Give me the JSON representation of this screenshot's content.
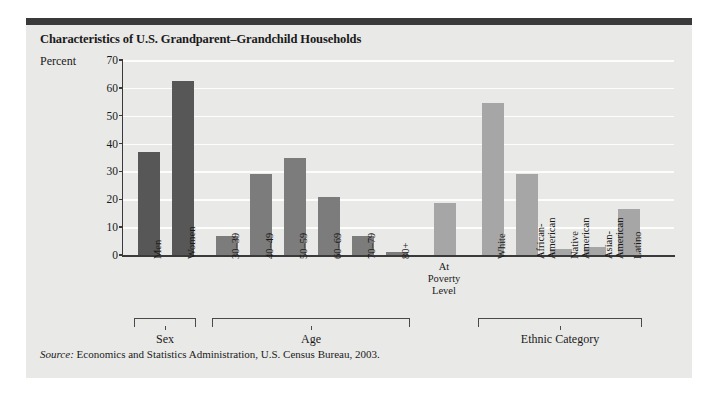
{
  "figure": {
    "title": "Characteristics of U.S. Grandparent–Grandchild Households",
    "axis_label": "Percent",
    "source_prefix": "Source:",
    "source_text": " Economics and Statistics Administration, U.S. Census Bureau, 2003."
  },
  "colors": {
    "panel_background": "#e9e9e7",
    "top_rule": "#3a3a3a",
    "gridline": "#fdfdfc",
    "axis": "#3a3a3a",
    "bar_sex": "#575757",
    "bar_age": "#7c7c7c",
    "bar_ethnic": "#a6a6a6",
    "text": "#1a1a1a"
  },
  "chart_data": {
    "type": "bar",
    "title": "Characteristics of U.S. Grandparent–Grandchild Households",
    "xlabel": "",
    "ylabel": "Percent",
    "ylim": [
      0,
      70
    ],
    "yticks": [
      0,
      10,
      20,
      30,
      40,
      50,
      60,
      70
    ],
    "ytick_labels": [
      "0",
      "10",
      "20",
      "30",
      "40",
      "50",
      "60",
      "70"
    ],
    "grid": true,
    "legend": "none",
    "categories": [
      "Men",
      "Women",
      "30–39",
      "40–49",
      "50–59",
      "60–69",
      "70–79",
      "80+",
      "At Poverty Level",
      "White",
      "African-American",
      "Native American",
      "Asian-American",
      "Latino"
    ],
    "values": [
      37,
      62.5,
      7,
      29,
      35,
      21,
      7,
      1,
      18.5,
      54.5,
      29,
      2,
      3,
      16.5
    ],
    "groups": [
      {
        "label": "Sex",
        "categories": [
          "Men",
          "Women"
        ]
      },
      {
        "label": "Age",
        "categories": [
          "30–39",
          "40–49",
          "50–59",
          "60–69",
          "70–79",
          "80+"
        ]
      },
      {
        "label": "Ethnic Category",
        "categories": [
          "White",
          "African-American",
          "Native American",
          "Asian-American",
          "Latino"
        ]
      }
    ],
    "ungrouped": [
      "At Poverty Level"
    ],
    "source": "Source: Economics and Statistics Administration, U.S. Census Bureau, 2003."
  },
  "bars": [
    {
      "label": "Men",
      "label_lines": [
        "Men"
      ],
      "value": 37,
      "group": "sex",
      "rotated": true
    },
    {
      "label": "Women",
      "label_lines": [
        "Women"
      ],
      "value": 62.5,
      "group": "sex",
      "rotated": true
    },
    {
      "label": "30–39",
      "label_lines": [
        "30–39"
      ],
      "value": 7,
      "group": "age",
      "rotated": true
    },
    {
      "label": "40–49",
      "label_lines": [
        "40–49"
      ],
      "value": 29,
      "group": "age",
      "rotated": true
    },
    {
      "label": "50–59",
      "label_lines": [
        "50–59"
      ],
      "value": 35,
      "group": "age",
      "rotated": true
    },
    {
      "label": "60–69",
      "label_lines": [
        "60–69"
      ],
      "value": 21,
      "group": "age",
      "rotated": true
    },
    {
      "label": "70–79",
      "label_lines": [
        "70–79"
      ],
      "value": 7,
      "group": "age",
      "rotated": true
    },
    {
      "label": "80+",
      "label_lines": [
        "80+"
      ],
      "value": 1,
      "group": "age",
      "rotated": true
    },
    {
      "label": "At Poverty Level",
      "label_lines": [
        "At",
        "Poverty",
        "Level"
      ],
      "value": 18.5,
      "group": "poverty",
      "rotated": false
    },
    {
      "label": "White",
      "label_lines": [
        "White"
      ],
      "value": 54.5,
      "group": "ethnic",
      "rotated": true
    },
    {
      "label": "African-American",
      "label_lines": [
        "African-",
        "American"
      ],
      "value": 29,
      "group": "ethnic",
      "rotated": true
    },
    {
      "label": "Native American",
      "label_lines": [
        "Native",
        "American"
      ],
      "value": 2,
      "group": "ethnic",
      "rotated": true
    },
    {
      "label": "Asian-American",
      "label_lines": [
        "Asian-",
        "American"
      ],
      "value": 3,
      "group": "ethnic",
      "rotated": true
    },
    {
      "label": "Latino",
      "label_lines": [
        "Latino"
      ],
      "value": 16.5,
      "group": "ethnic",
      "rotated": true
    }
  ],
  "group_brackets": [
    {
      "name": "sex",
      "label": "Sex",
      "from": 0,
      "to": 1
    },
    {
      "name": "age",
      "label": "Age",
      "from": 2,
      "to": 7
    },
    {
      "name": "ethnic",
      "label": "Ethnic Category",
      "from": 9,
      "to": 13
    }
  ]
}
